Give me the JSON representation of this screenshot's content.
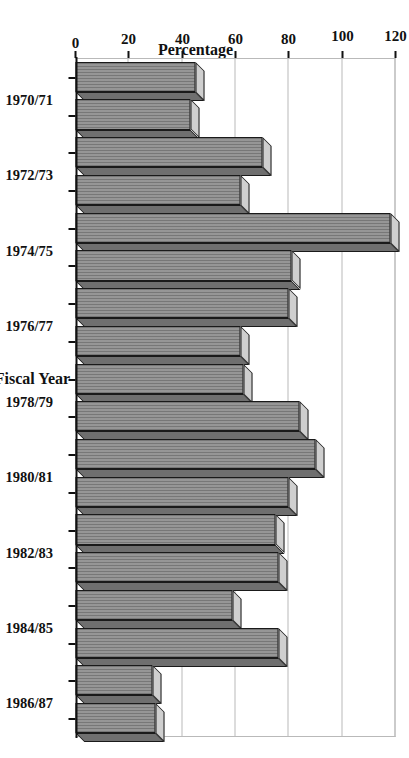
{
  "figure": {
    "value_axis_title": "Percentage",
    "category_axis_title": "Fiscal Year"
  },
  "colors": {
    "bar_front": "#8a8a8a",
    "bar_top": "#cfcfcf",
    "bar_side": "#6f6f6f",
    "bar_edge": "#1a1a1a",
    "gridline": "#b9b9b9",
    "axis": "#111111",
    "background": "#ffffff"
  },
  "chart_data": {
    "type": "bar",
    "orientation": "horizontal",
    "style": "3d",
    "title": "",
    "subtitle": "",
    "xlabel": "Fiscal Year",
    "ylabel": "Percentage",
    "ylim": [
      0,
      120
    ],
    "ytick_labels": [
      "0",
      "20",
      "40",
      "60",
      "80",
      "100",
      "120"
    ],
    "yticks": [
      0,
      20,
      40,
      60,
      80,
      100,
      120
    ],
    "grid": true,
    "legend": null,
    "legend_position": "none",
    "annotations": [],
    "categories": [
      "1970/71",
      "1971/72",
      "1972/73",
      "1973/74",
      "1974/75",
      "1975/76",
      "1976/77",
      "1977/78",
      "1978/79",
      "1979/80",
      "1980/81",
      "1981/82",
      "1982/83",
      "1983/84",
      "1984/85",
      "1985/86",
      "1986/87",
      "1987/88"
    ],
    "visible_category_tick_labels": [
      "1970/71",
      "1972/73",
      "1974/75",
      "1976/77",
      "1978/79",
      "1980/81",
      "1982/83",
      "1984/85",
      "1986/87"
    ],
    "values": [
      45,
      43,
      70,
      62,
      118,
      81,
      80,
      62,
      63,
      84,
      90,
      80,
      75,
      76,
      59,
      76,
      29,
      30
    ],
    "series": [
      {
        "name": "Percentage",
        "values": [
          45,
          43,
          70,
          62,
          118,
          81,
          80,
          62,
          63,
          84,
          90,
          80,
          75,
          76,
          59,
          76,
          29,
          30
        ]
      }
    ]
  }
}
